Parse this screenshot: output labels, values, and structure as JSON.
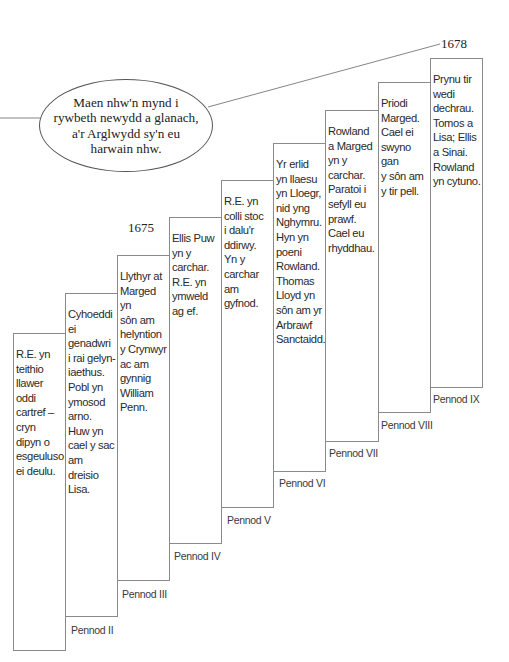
{
  "diagram": {
    "type": "timeline-staircase",
    "speech_bubble": {
      "text": "Maen nhw'n mynd i\nrywbeth newydd a glanach,\na'r Arglwydd sy'n eu\nharwain nhw."
    },
    "years": {
      "start": "1675",
      "end": "1678"
    },
    "chapters": [
      {
        "label": "Pennod I",
        "text": "R.E. yn\nteithio\nllawer\noddi\ncartref  –\ncryn\ndipyn o\nesgeuluso\nei deulu."
      },
      {
        "label": "Pennod II",
        "text": "Cyhoeddi\nei\ngenadwri\ni rai gelyn-\niaethus.\nPobl yn\nymosod\narno.\nHuw yn\ncael y sac\nam dreisio\nLisa."
      },
      {
        "label": "Pennod III",
        "text": "Llythyr at\nMarged yn\nsôn am\nhelyntion\ny Crynwyr\nac am\ngynnig\nWilliam\nPenn."
      },
      {
        "label": "Pennod IV",
        "text": "Ellis Puw\nyn y\ncarchar.\nR.E. yn\nymweld\nag ef."
      },
      {
        "label": "Pennod V",
        "text": "R.E. yn\ncolli stoc\ni dalu'r\nddirwy.\nYn y\ncarchar\nam\ngyfnod."
      },
      {
        "label": "Pennod VI",
        "text": "Yr erlid\nyn llaesu\nyn Lloegr,\nnid yng\nNghymru.\nHyn yn\npoeni\nRowland.\nThomas\nLloyd yn\nsôn am yr\nArbrawf\nSanctaidd."
      },
      {
        "label": "Pennod VII",
        "text": "Rowland\na Marged\nyn y\ncarchar.\nParatoi i\nsefyll eu\nprawf.\nCael eu\nrhyddhau."
      },
      {
        "label": "Pennod VIII",
        "text": "Priodi\nMarged.\nCael ei\nswyno gan\ny sôn am\ny tir pell."
      },
      {
        "label": "Pennod IX",
        "text": "Prynu tir\nwedi\ndechrau.\nTomos a\nLisa; Ellis\na Sinai.\nRowland\nyn cytuno."
      }
    ],
    "colors": {
      "box_border": "#8a8a8a",
      "text": "#2a2a2a",
      "background": "#ffffff"
    }
  }
}
